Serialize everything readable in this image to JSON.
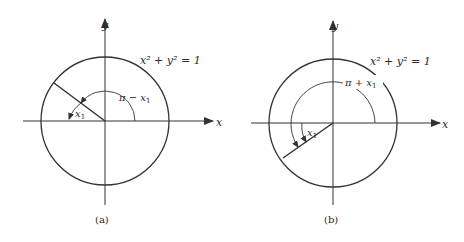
{
  "figures": [
    {
      "id": "a",
      "caption": "(a)",
      "equation": "x² + y² = 1",
      "x_axis_label": "x",
      "y_axis_label": "y",
      "outer_angle_label": "π − x",
      "outer_angle_sub": "1",
      "inner_angle_label": "x",
      "inner_angle_sub": "1",
      "description": "Unit circle with terminal ray in quadrant II at angle π − x₁; reference angle x₁ measured from negative x-axis"
    },
    {
      "id": "b",
      "caption": "(b)",
      "equation": "x² + y² = 1",
      "x_axis_label": "x",
      "y_axis_label": "y",
      "outer_angle_label": "π + x",
      "outer_angle_sub": "1",
      "inner_angle_label": "x",
      "inner_angle_sub": "1",
      "description": "Unit circle with terminal ray in quadrant III at angle π + x₁; reference angle x₁ measured from negative x-axis"
    }
  ],
  "colors": {
    "line": "#333333",
    "text": "#2a2a2a",
    "background": "#ffffff"
  }
}
